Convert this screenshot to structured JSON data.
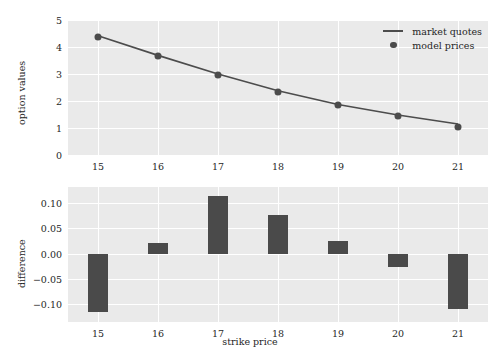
{
  "chart_data": [
    {
      "type": "line",
      "id": "option-values",
      "title": "",
      "xlabel": "",
      "ylabel": "option values",
      "x": [
        15,
        16,
        17,
        18,
        19,
        20,
        21
      ],
      "xtick_labels": [
        "15",
        "16",
        "17",
        "18",
        "19",
        "20",
        "21"
      ],
      "ytick_labels": [
        "0",
        "1",
        "2",
        "3",
        "4",
        "5"
      ],
      "yticks": [
        0,
        1,
        2,
        3,
        4,
        5
      ],
      "xlim": [
        14.5,
        21.5
      ],
      "ylim": [
        0,
        5
      ],
      "grid": true,
      "legend_position": "upper right",
      "series": [
        {
          "name": "market quotes",
          "style": "line",
          "color": "#4c4c4c",
          "values": [
            4.42,
            3.69,
            3.0,
            2.38,
            1.87,
            1.48,
            1.15
          ]
        },
        {
          "name": "model prices",
          "style": "marker",
          "color": "#4c4c4c",
          "values": [
            4.37,
            3.66,
            2.96,
            2.35,
            1.85,
            1.46,
            1.05
          ]
        }
      ]
    },
    {
      "type": "bar",
      "id": "difference",
      "title": "",
      "xlabel": "strike price",
      "ylabel": "difference",
      "categories": [
        "15",
        "16",
        "17",
        "18",
        "19",
        "20",
        "21"
      ],
      "x": [
        15,
        16,
        17,
        18,
        19,
        20,
        21
      ],
      "values": [
        -0.115,
        0.022,
        0.115,
        0.077,
        0.025,
        -0.027,
        -0.11
      ],
      "xtick_labels": [
        "15",
        "16",
        "17",
        "18",
        "19",
        "20",
        "21"
      ],
      "ytick_labels": [
        "0.10",
        "0.05",
        "0.00",
        "−0.05",
        "−0.10"
      ],
      "yticks": [
        0.1,
        0.05,
        0.0,
        -0.05,
        -0.1
      ],
      "xlim": [
        14.5,
        21.5
      ],
      "ylim": [
        -0.135,
        0.132
      ],
      "grid": true,
      "bar_color": "#4a4a4a"
    }
  ],
  "figure": {
    "background": "#ffffff",
    "axes_background": "#eaeaea",
    "grid_color": "#ffffff",
    "text_color": "#262626"
  },
  "legend": {
    "items": [
      {
        "label": "market quotes",
        "symbol": "line-swatch"
      },
      {
        "label": "model prices",
        "symbol": "dot-swatch"
      }
    ]
  }
}
